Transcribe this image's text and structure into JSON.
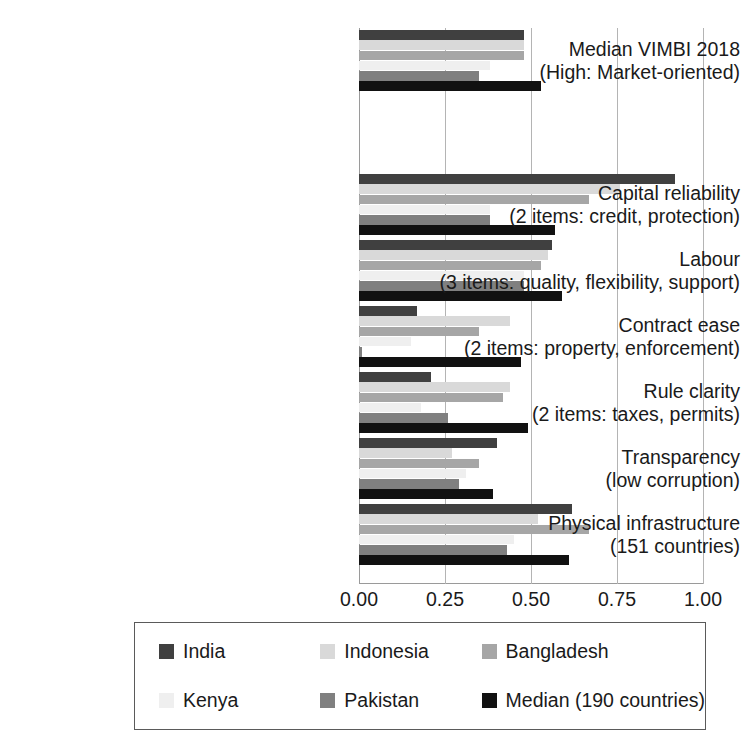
{
  "chart_data": {
    "type": "bar",
    "orientation": "horizontal",
    "title": "",
    "xlabel": "",
    "ylabel": "",
    "xlim": [
      0.0,
      1.0
    ],
    "xticks": [
      "0.00",
      "0.25",
      "0.50",
      "0.75",
      "1.00"
    ],
    "xtick_values": [
      0.0,
      0.25,
      0.5,
      0.75,
      1.0
    ],
    "grid": "vertical",
    "legend_position": "bottom",
    "categories": [
      {
        "line1": "Median VIMBI 2018",
        "line2": "(High: Market-oriented)"
      },
      {
        "line1": "Capital reliability",
        "line2": "(2 items: credit, protection)"
      },
      {
        "line1": "Labour",
        "line2": "(3 items: quality, flexibility, support)"
      },
      {
        "line1": "Contract ease",
        "line2": "(2 items: property, enforcement)"
      },
      {
        "line1": "Rule clarity",
        "line2": "(2 items: taxes, permits)"
      },
      {
        "line1": "Transparency",
        "line2": "(low corruption)"
      },
      {
        "line1": "Physical infrastructure",
        "line2": "(151 countries)"
      }
    ],
    "series": [
      {
        "name": "India",
        "color": "#404040",
        "values": [
          0.48,
          0.92,
          0.56,
          0.17,
          0.21,
          0.4,
          0.62
        ]
      },
      {
        "name": "Indonesia",
        "color": "#d9d9d9",
        "values": [
          0.48,
          0.76,
          0.55,
          0.44,
          0.44,
          0.27,
          0.52
        ]
      },
      {
        "name": "Bangladesh",
        "color": "#a6a6a6",
        "values": [
          0.48,
          0.67,
          0.53,
          0.35,
          0.42,
          0.35,
          0.67
        ]
      },
      {
        "name": "Kenya",
        "color": "#efefef",
        "values": [
          0.38,
          0.38,
          0.48,
          0.15,
          0.18,
          0.31,
          0.45
        ]
      },
      {
        "name": "Pakistan",
        "color": "#808080",
        "values": [
          0.35,
          0.38,
          0.48,
          0.01,
          0.26,
          0.29,
          0.43
        ]
      },
      {
        "name": "Median (190 countries)",
        "color": "#111111",
        "values": [
          0.53,
          0.57,
          0.59,
          0.47,
          0.49,
          0.39,
          0.61
        ]
      }
    ]
  },
  "legend": {
    "items": [
      {
        "label": "India",
        "color": "#404040"
      },
      {
        "label": "Indonesia",
        "color": "#d9d9d9"
      },
      {
        "label": "Bangladesh",
        "color": "#a6a6a6"
      },
      {
        "label": "Kenya",
        "color": "#efefef"
      },
      {
        "label": "Pakistan",
        "color": "#808080"
      },
      {
        "label": "Median (190 countries)",
        "color": "#111111"
      }
    ]
  },
  "axis": {
    "tick_labels": [
      "0.00",
      "0.25",
      "0.50",
      "0.75",
      "1.00"
    ]
  }
}
